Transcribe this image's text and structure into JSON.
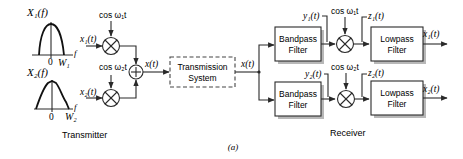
{
  "figure": {
    "caption": "(a)",
    "transmitter": {
      "label": "Transmitter",
      "spectrum1": {
        "label": "X₁(f)",
        "zero": "0",
        "bandwidth": "W₁",
        "axis": "f"
      },
      "spectrum2": {
        "label": "X₂(f)",
        "zero": "0",
        "bandwidth": "W₂",
        "axis": "f"
      },
      "input1": "x₁(t)",
      "input2": "x₂(t)",
      "carrier1": "cos ω₁t",
      "carrier2": "cos ω₂t",
      "sum_output": "x(t)"
    },
    "channel": {
      "label_line1": "Transmission",
      "label_line2": "System",
      "output": "x(t)"
    },
    "receiver": {
      "label": "Receiver",
      "branch1": {
        "bandpass_line1": "Bandpass",
        "bandpass_line2": "Filter",
        "bp_output": "y₁(t)",
        "carrier": "cos ω₁t",
        "mixer_output": "z₁(t)",
        "lowpass_line1": "Lowpass",
        "lowpass_line2": "Filter",
        "output": "x₁(t)"
      },
      "branch2": {
        "bandpass_line1": "Bandpass",
        "bandpass_line2": "Filter",
        "bp_output": "y₂(t)",
        "carrier": "cos ω₂t",
        "mixer_output": "z₂(t)",
        "lowpass_line1": "Lowpass",
        "lowpass_line2": "Filter",
        "output": "x₂(t)"
      }
    }
  },
  "icons": {
    "multiplier": "circle-times",
    "adder": "circle-plus",
    "arrow": "arrowhead"
  }
}
